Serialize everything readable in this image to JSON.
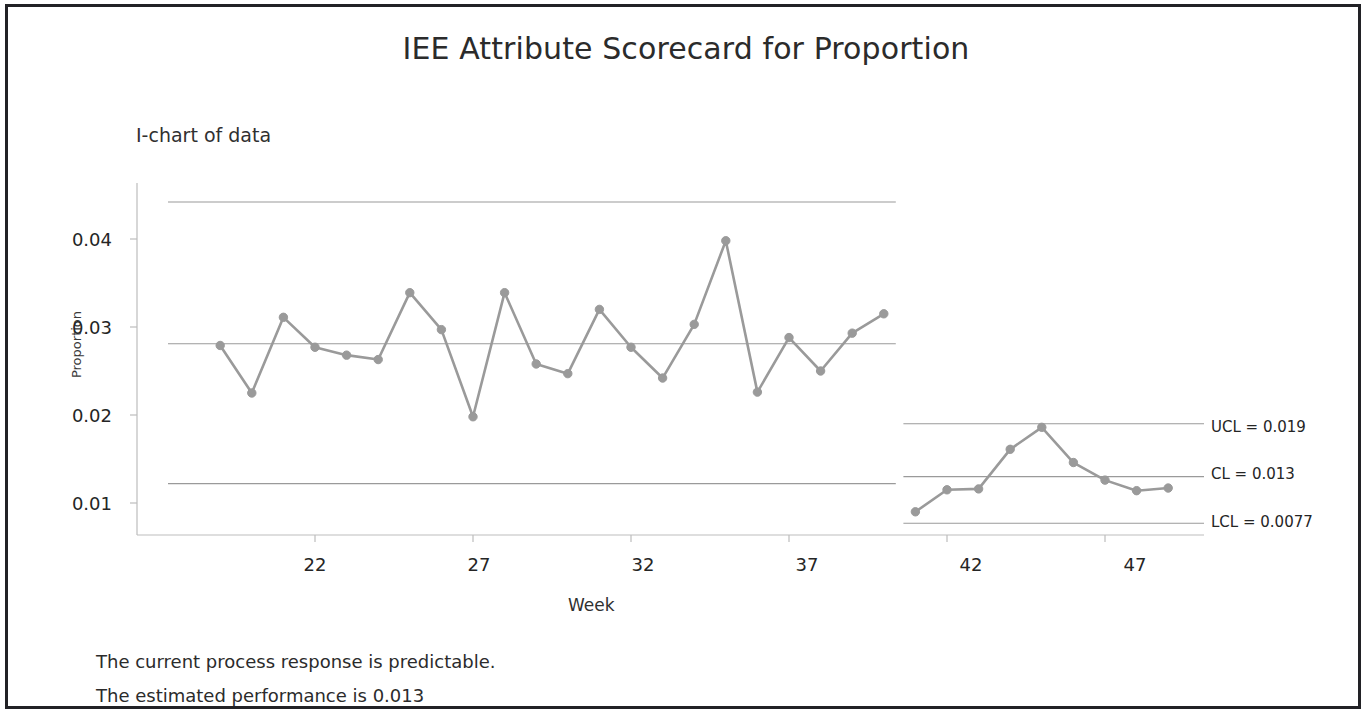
{
  "title": "IEE Attribute Scorecard for Proportion",
  "subtitle": "I-chart of data",
  "footer": {
    "line1": "The current process response is predictable.",
    "line2": "The estimated performance is 0.013"
  },
  "limits": {
    "ucl_label": "UCL = 0.019",
    "cl_label": "CL = 0.013",
    "lcl_label": "LCL = 0.0077"
  },
  "style": {
    "series_color": "#9a9a9a",
    "limit_line_color": "#9a9a9a",
    "axis_color": "#bdbdbd",
    "text_color": "#252525",
    "frame_color": "#222226"
  },
  "chart_data": {
    "type": "line",
    "title": "IEE Attribute Scorecard for Proportion",
    "subtitle": "I-chart of data",
    "xlabel": "Week",
    "ylabel": "Proportion",
    "xlim": [
      18.5,
      49.5
    ],
    "ylim": [
      0.0055,
      0.0455
    ],
    "grid": false,
    "legend": "none",
    "xticks": [
      22,
      27,
      32,
      37,
      42,
      47
    ],
    "yticks": [
      0.01,
      0.02,
      0.03,
      0.04
    ],
    "ytick_labels": [
      "0.01",
      "0.02",
      "0.03",
      "0.04"
    ],
    "annotations": [
      {
        "text": "UCL = 0.019",
        "y": 0.019,
        "position": "right"
      },
      {
        "text": "CL = 0.013",
        "y": 0.013,
        "position": "right"
      },
      {
        "text": "LCL = 0.0077",
        "y": 0.0077,
        "position": "right"
      }
    ],
    "series": [
      {
        "name": "Stage 1 data",
        "x": [
          19,
          20,
          21,
          22,
          23,
          24,
          25,
          26,
          27,
          28,
          29,
          30,
          31,
          32,
          33,
          34,
          35,
          36,
          37,
          38,
          39
        ],
        "values": [
          0.0279,
          0.0225,
          0.0311,
          0.0277,
          0.0268,
          0.0263,
          0.0339,
          0.0297,
          0.0198,
          0.0339,
          0.0258,
          0.0247,
          0.032,
          0.0277,
          0.0242,
          0.0303,
          0.0398,
          0.0226,
          0.0288,
          0.025,
          0.0293
        ]
      },
      {
        "name": "Stage 1 last point",
        "x": [
          40
        ],
        "values": [
          0.0315
        ]
      },
      {
        "name": "Stage 2 data",
        "x": [
          41,
          42,
          43,
          44,
          45,
          46,
          47,
          48,
          49
        ],
        "values": [
          0.009,
          0.0115,
          0.0116,
          0.0161,
          0.0186,
          0.0146,
          0.0126,
          0.0114,
          0.0117
        ]
      }
    ],
    "control_limits": [
      {
        "stage": 1,
        "x_start": 19,
        "x_end": 40,
        "ucl": 0.0442,
        "cl": 0.0281,
        "lcl": 0.0122
      },
      {
        "stage": 2,
        "x_start": 41,
        "x_end": 49,
        "ucl": 0.019,
        "cl": 0.013,
        "lcl": 0.0077
      }
    ]
  }
}
